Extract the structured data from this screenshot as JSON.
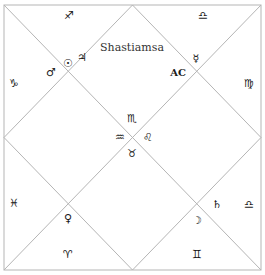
{
  "chart": {
    "title": "Shastiamsa",
    "ascendant_label": "AC",
    "line_color": "#b5b5b5",
    "frame": {
      "x1": 4,
      "y1": 5,
      "x2": 261,
      "y2": 270
    }
  },
  "signs": [
    {
      "name": "sagittarius",
      "symbol": "♐",
      "x": 69,
      "y": 15
    },
    {
      "name": "libra-top",
      "symbol": "♎",
      "x": 203,
      "y": 15
    },
    {
      "name": "capricorn",
      "symbol": "♑",
      "x": 14,
      "y": 83
    },
    {
      "name": "virgo",
      "symbol": "♍",
      "x": 249,
      "y": 83
    },
    {
      "name": "scorpio",
      "symbol": "♏",
      "x": 132,
      "y": 118
    },
    {
      "name": "aquarius",
      "symbol": "♒",
      "x": 120,
      "y": 137
    },
    {
      "name": "leo",
      "symbol": "♌",
      "x": 148,
      "y": 137
    },
    {
      "name": "taurus",
      "symbol": "♉",
      "x": 132,
      "y": 153
    },
    {
      "name": "pisces",
      "symbol": "♓",
      "x": 14,
      "y": 203
    },
    {
      "name": "libra-right",
      "symbol": "♎",
      "x": 249,
      "y": 204
    },
    {
      "name": "aries",
      "symbol": "♈",
      "x": 68,
      "y": 254
    },
    {
      "name": "gemini",
      "symbol": "♊",
      "x": 197,
      "y": 254
    }
  ],
  "planets": [
    {
      "name": "sun",
      "symbol": "☉",
      "x": 68,
      "y": 63
    },
    {
      "name": "jupiter",
      "symbol": "♃",
      "x": 82,
      "y": 57
    },
    {
      "name": "mars",
      "symbol": "♂",
      "x": 51,
      "y": 72
    },
    {
      "name": "mercury",
      "symbol": "☿",
      "x": 196,
      "y": 58
    },
    {
      "name": "venus",
      "symbol": "♀",
      "x": 68,
      "y": 218
    },
    {
      "name": "saturn",
      "symbol": "♄",
      "x": 217,
      "y": 204
    },
    {
      "name": "moon",
      "symbol": "☽",
      "x": 197,
      "y": 220
    }
  ],
  "labels": {
    "title_pos": {
      "x": 132,
      "y": 47
    },
    "ac_pos": {
      "x": 178,
      "y": 72
    }
  }
}
